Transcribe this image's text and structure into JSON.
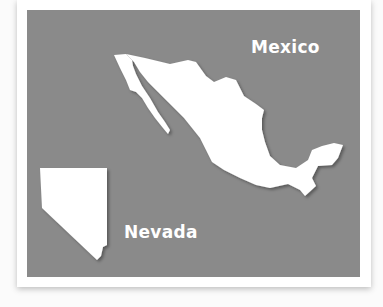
{
  "figure": {
    "panel_color": "#8a8a8a",
    "shape_color": "#ffffff",
    "labels": {
      "mexico": "Mexico",
      "nevada": "Nevada"
    },
    "shapes": [
      {
        "name": "Mexico",
        "icon": "mexico-map-shape"
      },
      {
        "name": "Nevada",
        "icon": "nevada-map-shape"
      }
    ]
  }
}
